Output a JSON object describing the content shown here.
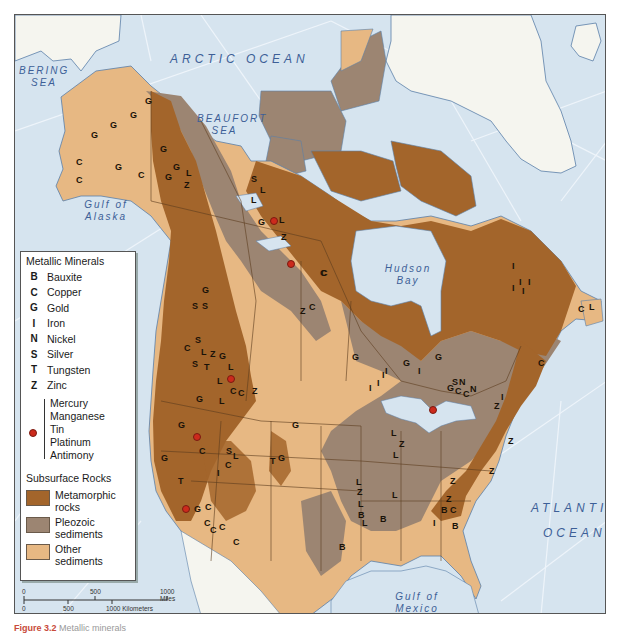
{
  "map": {
    "colors": {
      "ocean": "#d6e4ef",
      "greenland": "#f5f5ef",
      "metamorphic": "#a3652b",
      "paleozoic": "#9c8572",
      "other_sediments": "#e7b883",
      "mineral_dot": "#cc2a1c",
      "water_label": "#3d5f97"
    },
    "water_labels": {
      "arctic": "ARCTIC OCEAN",
      "bering": "BERING SEA",
      "beaufort": "BEAUFORT SEA",
      "alaska": "Gulf of Alaska",
      "hudson": "Hudson Bay",
      "atlantic": "ATLANTIC",
      "atlantic2": "OCEAN",
      "mexico": "Gulf of Mexico"
    },
    "mineral_symbols": [
      {
        "s": "G",
        "x": 147,
        "y": 100
      },
      {
        "s": "G",
        "x": 132,
        "y": 114
      },
      {
        "s": "G",
        "x": 112,
        "y": 124
      },
      {
        "s": "G",
        "x": 93,
        "y": 134
      },
      {
        "s": "G",
        "x": 162,
        "y": 148
      },
      {
        "s": "G",
        "x": 175,
        "y": 166
      },
      {
        "s": "G",
        "x": 167,
        "y": 176
      },
      {
        "s": "L",
        "x": 188,
        "y": 172
      },
      {
        "s": "Z",
        "x": 186,
        "y": 184
      },
      {
        "s": "C",
        "x": 78,
        "y": 161
      },
      {
        "s": "G",
        "x": 117,
        "y": 166
      },
      {
        "s": "C",
        "x": 140,
        "y": 174
      },
      {
        "s": "C",
        "x": 78,
        "y": 179
      },
      {
        "s": "S",
        "x": 253,
        "y": 178
      },
      {
        "s": "L",
        "x": 262,
        "y": 189
      },
      {
        "s": "L",
        "x": 253,
        "y": 199
      },
      {
        "s": "G",
        "x": 260,
        "y": 221
      },
      {
        "s": "L",
        "x": 281,
        "y": 219
      },
      {
        "s": "Z",
        "x": 283,
        "y": 236
      },
      {
        "s": "C",
        "x": 322,
        "y": 272
      },
      {
        "s": "Z",
        "x": 302,
        "y": 310
      },
      {
        "s": "C",
        "x": 311,
        "y": 306
      },
      {
        "s": "G",
        "x": 204,
        "y": 289
      },
      {
        "s": "S",
        "x": 194,
        "y": 305
      },
      {
        "s": "S",
        "x": 204,
        "y": 305
      },
      {
        "s": "S",
        "x": 197,
        "y": 339
      },
      {
        "s": "C",
        "x": 186,
        "y": 347
      },
      {
        "s": "L",
        "x": 203,
        "y": 351
      },
      {
        "s": "Z",
        "x": 212,
        "y": 353
      },
      {
        "s": "G",
        "x": 221,
        "y": 355
      },
      {
        "s": "S",
        "x": 194,
        "y": 363
      },
      {
        "s": "T",
        "x": 206,
        "y": 366
      },
      {
        "s": "L",
        "x": 230,
        "y": 366
      },
      {
        "s": "L",
        "x": 219,
        "y": 380
      },
      {
        "s": "C",
        "x": 232,
        "y": 390
      },
      {
        "s": "C",
        "x": 240,
        "y": 392
      },
      {
        "s": "Z",
        "x": 254,
        "y": 390
      },
      {
        "s": "G",
        "x": 198,
        "y": 398
      },
      {
        "s": "L",
        "x": 221,
        "y": 400
      },
      {
        "s": "G",
        "x": 180,
        "y": 424
      },
      {
        "s": "G",
        "x": 163,
        "y": 457
      },
      {
        "s": "C",
        "x": 201,
        "y": 450
      },
      {
        "s": "S",
        "x": 228,
        "y": 450
      },
      {
        "s": "L",
        "x": 235,
        "y": 455
      },
      {
        "s": "C",
        "x": 227,
        "y": 464
      },
      {
        "s": "I",
        "x": 219,
        "y": 472
      },
      {
        "s": "T",
        "x": 272,
        "y": 460
      },
      {
        "s": "G",
        "x": 280,
        "y": 457
      },
      {
        "s": "T",
        "x": 180,
        "y": 480
      },
      {
        "s": "G",
        "x": 196,
        "y": 508
      },
      {
        "s": "C",
        "x": 207,
        "y": 506
      },
      {
        "s": "C",
        "x": 206,
        "y": 522
      },
      {
        "s": "C",
        "x": 212,
        "y": 529
      },
      {
        "s": "C",
        "x": 221,
        "y": 526
      },
      {
        "s": "C",
        "x": 235,
        "y": 541
      },
      {
        "s": "G",
        "x": 294,
        "y": 424
      },
      {
        "s": "C",
        "x": 323,
        "y": 272
      },
      {
        "s": "G",
        "x": 354,
        "y": 356
      },
      {
        "s": "I",
        "x": 371,
        "y": 387
      },
      {
        "s": "I",
        "x": 379,
        "y": 382
      },
      {
        "s": "I",
        "x": 384,
        "y": 374
      },
      {
        "s": "I",
        "x": 387,
        "y": 370
      },
      {
        "s": "G",
        "x": 405,
        "y": 362
      },
      {
        "s": "I",
        "x": 420,
        "y": 370
      },
      {
        "s": "G",
        "x": 437,
        "y": 356
      },
      {
        "s": "S",
        "x": 454,
        "y": 381
      },
      {
        "s": "N",
        "x": 461,
        "y": 381
      },
      {
        "s": "G",
        "x": 449,
        "y": 387
      },
      {
        "s": "C",
        "x": 457,
        "y": 390
      },
      {
        "s": "C",
        "x": 465,
        "y": 393
      },
      {
        "s": "N",
        "x": 472,
        "y": 388
      },
      {
        "s": "Z",
        "x": 496,
        "y": 405
      },
      {
        "s": "I",
        "x": 503,
        "y": 396
      },
      {
        "s": "I",
        "x": 514,
        "y": 265
      },
      {
        "s": "I",
        "x": 521,
        "y": 281
      },
      {
        "s": "I",
        "x": 530,
        "y": 281
      },
      {
        "s": "I",
        "x": 514,
        "y": 287
      },
      {
        "s": "I",
        "x": 524,
        "y": 290
      },
      {
        "s": "C",
        "x": 580,
        "y": 308
      },
      {
        "s": "L",
        "x": 591,
        "y": 306
      },
      {
        "s": "C",
        "x": 540,
        "y": 362
      },
      {
        "s": "L",
        "x": 393,
        "y": 432
      },
      {
        "s": "Z",
        "x": 401,
        "y": 443
      },
      {
        "s": "L",
        "x": 395,
        "y": 454
      },
      {
        "s": "Z",
        "x": 510,
        "y": 440
      },
      {
        "s": "Z",
        "x": 491,
        "y": 470
      },
      {
        "s": "Z",
        "x": 452,
        "y": 480
      },
      {
        "s": "L",
        "x": 358,
        "y": 481
      },
      {
        "s": "Z",
        "x": 359,
        "y": 491
      },
      {
        "s": "L",
        "x": 360,
        "y": 503
      },
      {
        "s": "B",
        "x": 360,
        "y": 514
      },
      {
        "s": "L",
        "x": 364,
        "y": 522
      },
      {
        "s": "B",
        "x": 382,
        "y": 518
      },
      {
        "s": "L",
        "x": 394,
        "y": 494
      },
      {
        "s": "Z",
        "x": 448,
        "y": 498
      },
      {
        "s": "B",
        "x": 443,
        "y": 509
      },
      {
        "s": "C",
        "x": 452,
        "y": 509
      },
      {
        "s": "I",
        "x": 435,
        "y": 522
      },
      {
        "s": "B",
        "x": 454,
        "y": 525
      },
      {
        "s": "B",
        "x": 341,
        "y": 546
      }
    ],
    "mineral_dots": [
      {
        "x": 272,
        "y": 219
      },
      {
        "x": 289,
        "y": 262
      },
      {
        "x": 195,
        "y": 435
      },
      {
        "x": 184,
        "y": 507
      },
      {
        "x": 229,
        "y": 377
      },
      {
        "x": 431,
        "y": 408
      }
    ]
  },
  "legend": {
    "metallic_title": "Metallic Minerals",
    "metallic": [
      {
        "symbol": "B",
        "label": "Bauxite"
      },
      {
        "symbol": "C",
        "label": "Copper"
      },
      {
        "symbol": "G",
        "label": "Gold"
      },
      {
        "symbol": "I",
        "label": "Iron"
      },
      {
        "symbol": "N",
        "label": "Nickel"
      },
      {
        "symbol": "S",
        "label": "Silver"
      },
      {
        "symbol": "T",
        "label": "Tungsten"
      },
      {
        "symbol": "Z",
        "label": "Zinc"
      }
    ],
    "other_minerals": [
      "Mercury",
      "Manganese",
      "Tin",
      "Platinum",
      "Antimony"
    ],
    "rocks_title": "Subsurface Rocks",
    "rocks": [
      {
        "label1": "Metamorphic",
        "label2": "rocks",
        "color": "#a3652b"
      },
      {
        "label1": "Pleozoic",
        "label2": "sediments",
        "color": "#9c8572"
      },
      {
        "label1": "Other",
        "label2": "sediments",
        "color": "#e7b883"
      }
    ]
  },
  "scale": {
    "miles_labels": [
      "0",
      "500",
      "1000 Miles"
    ],
    "km_labels": [
      "0",
      "500",
      "1000 Kilometers"
    ]
  },
  "caption": {
    "prefix": "Figure 3.2",
    "text": "Metallic minerals of...",
    "visible_title": "Metallic minerals"
  }
}
